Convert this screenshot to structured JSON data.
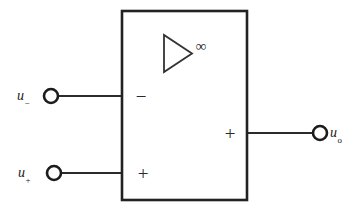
{
  "diagram": {
    "type": "circuit-schematic",
    "background_color": "#ffffff",
    "line_color": "#222222",
    "amplifier_block": {
      "shape": "rectangle",
      "x": 122,
      "y": 11,
      "width": 125,
      "height": 189,
      "inner_symbol": {
        "name": "amplifier-triangle",
        "gain_label": "∞"
      },
      "terminal_markers": [
        {
          "name": "inverting-input-sign",
          "symbol": "−",
          "x": 141,
          "y": 96
        },
        {
          "name": "noninverting-input-sign",
          "symbol": "+",
          "x": 143,
          "y": 173
        },
        {
          "name": "output-sign",
          "symbol": "+",
          "x": 230,
          "y": 133
        }
      ]
    },
    "ports": [
      {
        "name": "inverting-input",
        "base": "u",
        "subscript": "−",
        "terminal": {
          "cx": 51,
          "cy": 96,
          "r": 7
        },
        "wire": {
          "x1": 58,
          "y1": 96,
          "x2": 122,
          "y2": 96
        }
      },
      {
        "name": "noninverting-input",
        "base": "u",
        "subscript": "+",
        "terminal": {
          "cx": 54,
          "cy": 173,
          "r": 7
        },
        "wire": {
          "x1": 61,
          "y1": 173,
          "x2": 122,
          "y2": 173
        }
      },
      {
        "name": "output",
        "base": "u",
        "subscript": "o",
        "terminal": {
          "cx": 320,
          "cy": 133,
          "r": 7
        },
        "wire": {
          "x1": 247,
          "y1": 133,
          "x2": 313,
          "y2": 133
        }
      }
    ]
  }
}
